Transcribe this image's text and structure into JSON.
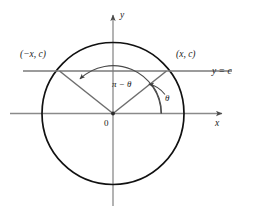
{
  "figure": {
    "colors": {
      "circle_stroke": "#111111",
      "axis_stroke": "#8a8a8a",
      "radius_stroke": "#6e6e6e",
      "chord_line_stroke": "#7a7a7a",
      "arc_stroke": "#4a4a4a",
      "text": "#1a1a1a",
      "background": "#ffffff"
    },
    "labels": {
      "y_axis": "y",
      "x_axis": "x",
      "origin": "0",
      "point_left": "(−x, c)",
      "point_right": "(x, c)",
      "line_equation": "y = c",
      "angle_supplement": "π − θ",
      "angle_theta": "θ"
    }
  },
  "geometry": {
    "center": {
      "x": 113,
      "y": 113.5
    },
    "radius": 71,
    "line_y_c": {
      "y": 71,
      "x_start": 23,
      "x_end": 232
    },
    "intersection_left": {
      "x": 59.5,
      "y": 71
    },
    "intersection_right": {
      "x": 166.5,
      "y": 71
    },
    "x_axis": {
      "x_start": 10,
      "x_end": 225,
      "y": 113.5
    },
    "y_axis": {
      "x": 113,
      "y_start": 12,
      "y_end": 206
    },
    "theta_degrees": 36.6,
    "supplement_degrees": 143.4
  }
}
